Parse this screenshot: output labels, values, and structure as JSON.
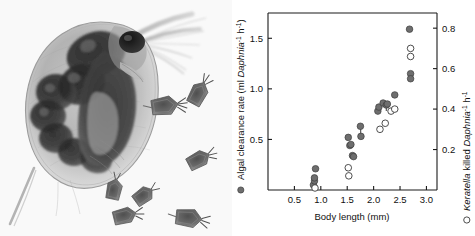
{
  "figure": {
    "panels": [
      "photograph",
      "scatter-plot"
    ]
  },
  "photo": {
    "alt": "microscope photograph of a Daphnia water flea with several Keratella rotifers",
    "subject": "Daphnia",
    "companions": "Keratella rotifers",
    "companion_count": 7
  },
  "chart_data": {
    "type": "scatter",
    "title": "",
    "xlabel": "Body length (mm)",
    "ylabel": "Algal clearance rate (ml Daphnia⁻¹ h⁻¹)",
    "y2label": "Keratella killed Daphnia⁻¹ h⁻¹",
    "xlim": [
      0.0,
      3.2
    ],
    "ylim": [
      0.0,
      1.75
    ],
    "y2lim": [
      0.0,
      0.875
    ],
    "xticks": [
      0.5,
      1.0,
      1.5,
      2.0,
      2.5,
      3.0
    ],
    "xticklabels": [
      "0.5",
      "1.0",
      "1.5",
      "2.0",
      "2.5",
      "3.0"
    ],
    "yticks": [
      0.5,
      1.0,
      1.5
    ],
    "yticklabels": [
      "0.5",
      "1.0",
      "1.5"
    ],
    "y2ticks": [
      0.2,
      0.4,
      0.6,
      0.8
    ],
    "y2ticklabels": [
      "0.2",
      "0.4",
      "0.6",
      "0.8"
    ],
    "grid": false,
    "legend_position": "axis-labels",
    "series": [
      {
        "name": "Algal clearance rate",
        "marker": "filled-circle",
        "axis": "left",
        "color": "#6e6e6e",
        "x": [
          0.86,
          0.88,
          0.88,
          0.9,
          1.52,
          1.55,
          1.57,
          1.6,
          1.62,
          1.75,
          1.76,
          2.08,
          2.1,
          2.18,
          2.24,
          2.26,
          2.4,
          2.68,
          2.7,
          2.7
        ],
        "y": [
          0.05,
          0.09,
          0.12,
          0.21,
          0.52,
          0.44,
          0.45,
          0.34,
          0.33,
          0.63,
          0.53,
          0.78,
          0.82,
          0.86,
          0.84,
          0.85,
          0.94,
          1.59,
          1.15,
          1.1
        ]
      },
      {
        "name": "Keratella killed",
        "marker": "open-circle",
        "axis": "right",
        "color": "#ffffff",
        "x": [
          0.89,
          1.52,
          1.53,
          2.12,
          2.22,
          2.33,
          2.4,
          2.7,
          2.7
        ],
        "y2": [
          0.01,
          0.11,
          0.07,
          0.3,
          0.33,
          0.39,
          0.4,
          0.7,
          0.66
        ]
      }
    ],
    "connectors": [
      {
        "x": 1.755,
        "y_low": 0.53,
        "y_high": 0.63
      },
      {
        "x": 2.24,
        "y_low": 0.78,
        "y_high": 0.855
      }
    ]
  }
}
